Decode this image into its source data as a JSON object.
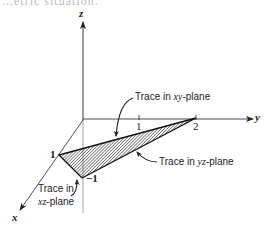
{
  "diagram": {
    "type": "3d-coordinate-plot",
    "top_text_fragment": "...etric situation.",
    "axes": {
      "x": {
        "label": "x"
      },
      "y": {
        "label": "y"
      },
      "z": {
        "label": "z"
      }
    },
    "ticks": {
      "x_1": "1",
      "y_1": "1",
      "y_2": "2",
      "z_neg1": "−1"
    },
    "annotations": {
      "xy_trace": {
        "prefix": "Trace in ",
        "var": "xy",
        "suffix": "-plane"
      },
      "yz_trace": {
        "prefix": "Trace in ",
        "var": "yz",
        "suffix": "-plane"
      },
      "xz_trace_line1": "Trace in",
      "xz_trace_line2": {
        "var": "xz",
        "suffix": "-plane"
      }
    },
    "triangle_vertices": [
      {
        "label": "(1,0,0)",
        "screen": [
          59,
          155
        ]
      },
      {
        "label": "(0,2,0)",
        "screen": [
          196,
          118
        ]
      },
      {
        "label": "(0,0,-1)",
        "screen": [
          82,
          178
        ]
      }
    ],
    "colors": {
      "ink": "#222222",
      "axis_below": "#999999",
      "hatch": "#333333",
      "background": "#ffffff"
    }
  }
}
